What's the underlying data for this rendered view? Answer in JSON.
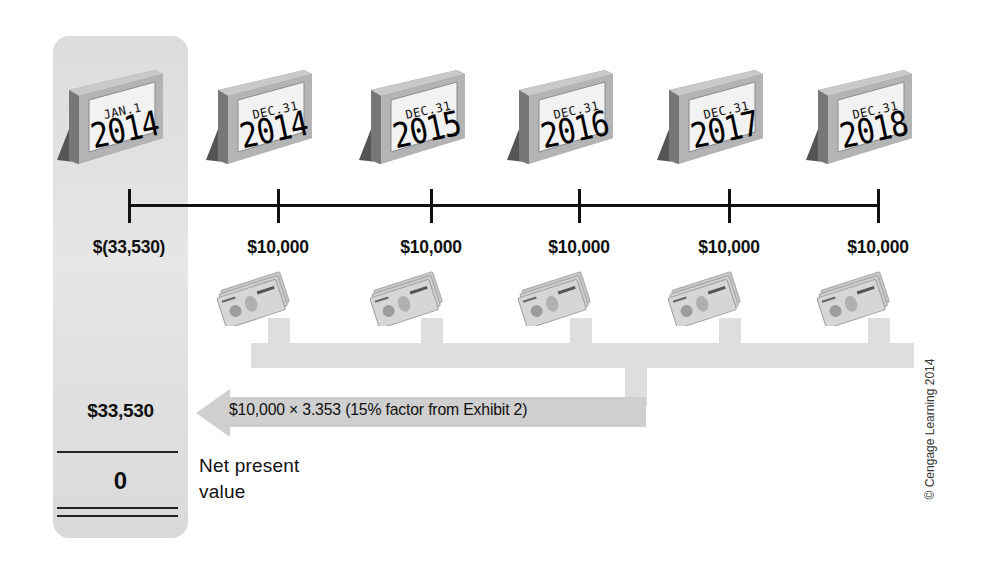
{
  "diagram": {
    "type": "net-present-value-timeline",
    "timeline": [
      {
        "month": "JAN.1",
        "year": "2014",
        "cash_flow": "$(33,530)",
        "x": 129
      },
      {
        "month": "DEC.31",
        "year": "2014",
        "cash_flow": "$10,000",
        "x": 278
      },
      {
        "month": "DEC.31",
        "year": "2015",
        "cash_flow": "$10,000",
        "x": 431
      },
      {
        "month": "DEC.31",
        "year": "2016",
        "cash_flow": "$10,000",
        "x": 579
      },
      {
        "month": "DEC.31",
        "year": "2017",
        "cash_flow": "$10,000",
        "x": 729
      },
      {
        "month": "DEC.31",
        "year": "2018",
        "cash_flow": "$10,000",
        "x": 878
      }
    ],
    "arrow_label": "$10,000 × 3.353 (15% factor from Exhibit 2)",
    "present_value_amount": "$33,530",
    "npv_value": "0",
    "npv_label_line1": "Net present",
    "npv_label_line2": "value",
    "copyright": "© Cengage Learning 2014",
    "colors": {
      "column_fill": "#dddddd",
      "flow_fill": "#dedede",
      "arrow_fill": "#cfcfcf",
      "line": "#111111"
    }
  }
}
